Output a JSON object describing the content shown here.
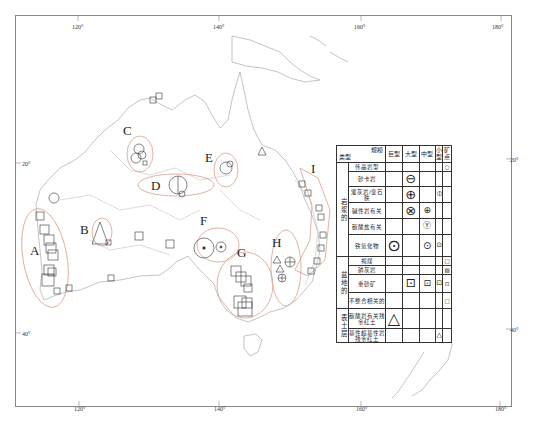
{
  "map": {
    "frame_color": "#888888",
    "coastline_color": "#aaaaaa",
    "ellipse_color": "#d9a08a",
    "longitude_ticks_top": [
      "120°",
      "140°",
      "160°",
      "180°"
    ],
    "longitude_ticks_bottom": [
      "120°",
      "140°",
      "160°",
      "180°"
    ],
    "latitude_ticks_left": [
      "20°",
      "40°"
    ],
    "latitude_ticks_right": [
      "20°",
      "40°"
    ],
    "regions": [
      {
        "id": "A",
        "label": "A"
      },
      {
        "id": "B",
        "label": "B"
      },
      {
        "id": "C",
        "label": "C"
      },
      {
        "id": "D",
        "label": "D"
      },
      {
        "id": "E",
        "label": "E"
      },
      {
        "id": "F",
        "label": "F"
      },
      {
        "id": "G",
        "label": "G"
      },
      {
        "id": "H",
        "label": "H"
      },
      {
        "id": "I",
        "label": "I"
      }
    ]
  },
  "legend": {
    "header": {
      "scale_label": "规模",
      "type_label": "类型",
      "columns": [
        "巨型",
        "大型",
        "中型",
        "小型",
        "矿点"
      ]
    },
    "groups": [
      {
        "category": "岩浆的",
        "rows": [
          {
            "type": "伟晶岩型",
            "symbols": [
              "",
              "",
              "",
              "",
              "○"
            ]
          },
          {
            "type": "砂卡岩",
            "symbols": [
              "",
              "⊖",
              "",
              "",
              ""
            ]
          },
          {
            "type": "灌灰岩/变石肤",
            "symbols": [
              "",
              "⊕",
              "",
              "⦶",
              ""
            ]
          },
          {
            "type": "碱性岩有关",
            "symbols": [
              "",
              "⊗",
              "⊕",
              "",
              ""
            ]
          },
          {
            "type": "碳酸盐有关",
            "symbols": [
              "",
              "",
              "Ⓨ",
              "",
              ""
            ]
          },
          {
            "type": "铁氧化物",
            "symbols": [
              "⊙",
              "",
              "⊙",
              "⊙",
              ""
            ]
          }
        ]
      },
      {
        "category": "盆地的",
        "rows": [
          {
            "type": "褐煤",
            "symbols": [
              "",
              "",
              "",
              "",
              "□"
            ]
          },
          {
            "type": "磷灰岩",
            "symbols": [
              "",
              "",
              "",
              "",
              "▧"
            ]
          },
          {
            "type": "重砂矿",
            "symbols": [
              "",
              "⊡",
              "⊡",
              "⊡",
              "⊡"
            ]
          },
          {
            "type": "不整合相关的",
            "symbols": [
              "",
              "",
              "",
              "",
              "□"
            ]
          }
        ]
      },
      {
        "category": "表土层",
        "rows": [
          {
            "type": "碳酸岩有关残余红土",
            "symbols": [
              "△",
              "",
              "",
              "",
              ""
            ]
          },
          {
            "type": "基性超基性岩残余红土",
            "symbols": [
              "",
              "",
              "",
              "△",
              ""
            ]
          }
        ]
      }
    ]
  },
  "caption": ""
}
